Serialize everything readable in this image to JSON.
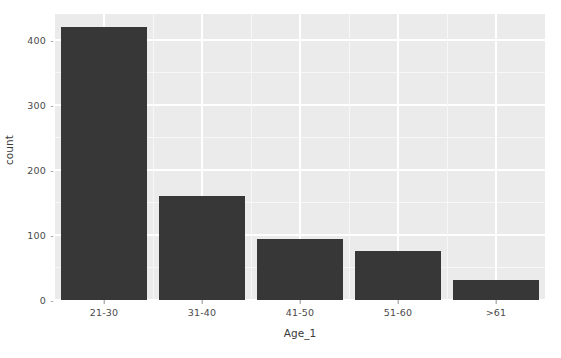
{
  "chart_data": {
    "type": "bar",
    "title": "",
    "subtitle": "",
    "xlabel": "Age_1",
    "ylabel": "count",
    "categories": [
      "21-30",
      "31-40",
      "41-50",
      "51-60",
      ">61"
    ],
    "values": [
      420,
      160,
      94,
      75,
      31
    ],
    "series": [
      {
        "name": "count",
        "values": [
          420,
          160,
          94,
          75,
          31
        ]
      }
    ],
    "ylim": [
      0,
      440
    ],
    "xlim": [
      0,
      5
    ],
    "y_ticks": [
      0,
      100,
      200,
      300,
      400
    ],
    "y_tick_labels": [
      "0",
      "100",
      "200",
      "300",
      "400"
    ],
    "x_tick_labels": [
      "21-30",
      "31-40",
      "41-50",
      "51-60",
      ">61"
    ],
    "grid": true,
    "grid_major_color": "#ffffff",
    "grid_minor_color": "#f7f7f7",
    "legend": null,
    "legend_position": "none",
    "bar_color": "#373737",
    "panel_background": "#ebebeb",
    "plot_background": "#ffffff",
    "annotations": []
  },
  "axes": {
    "y_title": "count",
    "x_title": "Age_1",
    "tick_mark_glyph": "-"
  }
}
